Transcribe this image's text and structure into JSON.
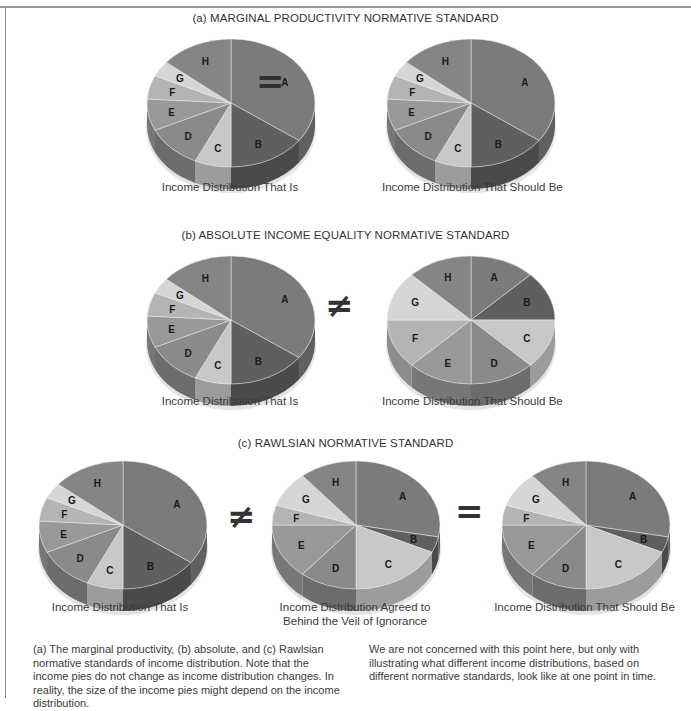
{
  "header": {
    "partial_title": "Different Normative Standards of Income Distribution"
  },
  "sections": [
    {
      "id": "a",
      "title": "(a) MARGINAL PRODUCTIVITY NORMATIVE STANDARD",
      "pies": [
        {
          "caption": "Income Distribution That Is"
        },
        {
          "caption": "Income Distribution That Should Be"
        }
      ],
      "operators": [
        "="
      ]
    },
    {
      "id": "b",
      "title": "(b) ABSOLUTE INCOME EQUALITY NORMATIVE STANDARD",
      "pies": [
        {
          "caption": "Income Distribution That Is"
        },
        {
          "caption": "Income Distribution That Should Be"
        }
      ],
      "operators": [
        "≠"
      ]
    },
    {
      "id": "c",
      "title": "(c) RAWLSIAN NORMATIVE STANDARD",
      "pies": [
        {
          "caption": "Income Distribution That Is"
        },
        {
          "caption_line1": "Income Distribution Agreed to",
          "caption_line2": "Behind the Veil of Ignorance"
        },
        {
          "caption": "Income Distribution That Should Be"
        }
      ],
      "operators": [
        "≠",
        "="
      ]
    }
  ],
  "caption": {
    "left": "(a) The marginal productivity, (b) absolute, and (c) Rawlsian normative standards of income distribution. Note that the income pies do not change as income distribution changes. In reality, the size of the income pies might depend on the income distribution.",
    "right": "We are not concerned with this point here, but only with illustrating what different income distributions, based on different normative standards, look like at one point in time."
  },
  "chart_data": [
    {
      "type": "pie",
      "title": "(a) Income Distribution That Is",
      "categories": [
        "A",
        "B",
        "C",
        "D",
        "E",
        "F",
        "G",
        "H"
      ],
      "values": [
        35,
        15,
        7,
        11,
        8,
        6,
        4,
        14
      ]
    },
    {
      "type": "pie",
      "title": "(a) Income Distribution That Should Be",
      "categories": [
        "A",
        "B",
        "C",
        "D",
        "E",
        "F",
        "G",
        "H"
      ],
      "values": [
        35,
        15,
        7,
        11,
        8,
        6,
        4,
        14
      ]
    },
    {
      "type": "pie",
      "title": "(b) Income Distribution That Is",
      "categories": [
        "A",
        "B",
        "C",
        "D",
        "E",
        "F",
        "G",
        "H"
      ],
      "values": [
        35,
        15,
        7,
        11,
        8,
        6,
        4,
        14
      ]
    },
    {
      "type": "pie",
      "title": "(b) Income Distribution That Should Be",
      "categories": [
        "A",
        "B",
        "C",
        "D",
        "E",
        "F",
        "G",
        "H"
      ],
      "values": [
        12.5,
        12.5,
        12.5,
        12.5,
        12.5,
        12.5,
        12.5,
        12.5
      ]
    },
    {
      "type": "pie",
      "title": "(c) Income Distribution That Is",
      "categories": [
        "A",
        "B",
        "C",
        "D",
        "E",
        "F",
        "G",
        "H"
      ],
      "values": [
        35,
        15,
        7,
        11,
        8,
        6,
        4,
        14
      ]
    },
    {
      "type": "pie",
      "title": "(c) Income Distribution Agreed to Behind the Veil of Ignorance",
      "categories": [
        "A",
        "B",
        "C",
        "D",
        "E",
        "F",
        "G",
        "H"
      ],
      "values": [
        28,
        4,
        18,
        11,
        14,
        5,
        9,
        11
      ]
    },
    {
      "type": "pie",
      "title": "(c) Income Distribution That Should Be",
      "categories": [
        "A",
        "B",
        "C",
        "D",
        "E",
        "F",
        "G",
        "H"
      ],
      "values": [
        28,
        4,
        18,
        11,
        14,
        5,
        9,
        11
      ]
    }
  ],
  "colors": {
    "A": "#7b7b7b",
    "B": "#5f5f5f",
    "C": "#c8c8c8",
    "D": "#8a8a8a",
    "E": "#999999",
    "F": "#b4b4b4",
    "G": "#d6d6d6",
    "H": "#858585"
  }
}
